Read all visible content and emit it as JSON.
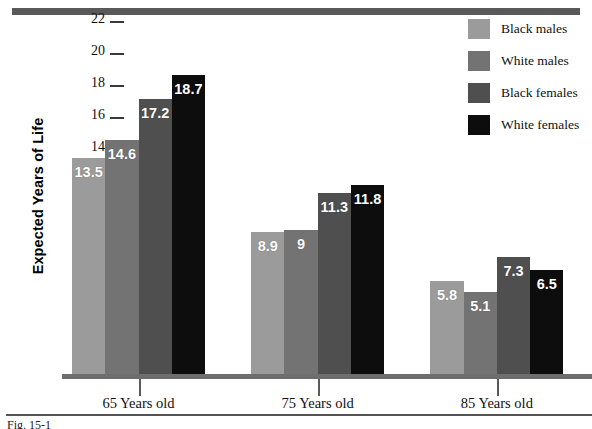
{
  "chart_data": {
    "type": "bar",
    "title": "",
    "xlabel": "",
    "ylabel": "Expected Years of Life",
    "ylim": [
      0,
      22
    ],
    "yticks": [
      0,
      2,
      4,
      6,
      8,
      10,
      12,
      14,
      16,
      18,
      20,
      22
    ],
    "grid": false,
    "legend_position": "top-right",
    "categories": [
      "65 Years old",
      "75 Years old",
      "85 Years old"
    ],
    "series": [
      {
        "name": "Black males",
        "color": "#9b9b9b",
        "values": [
          13.5,
          8.9,
          5.8
        ],
        "labels": [
          "13.5",
          "8.9",
          "5.8"
        ]
      },
      {
        "name": "White males",
        "color": "#737373",
        "values": [
          14.6,
          9.0,
          5.1
        ],
        "labels": [
          "14.6",
          "9",
          "5.1"
        ]
      },
      {
        "name": "Black females",
        "color": "#4f4f4f",
        "values": [
          17.2,
          11.3,
          7.3
        ],
        "labels": [
          "17.2",
          "11.3",
          "7.3"
        ]
      },
      {
        "name": "White females",
        "color": "#0d0d0d",
        "values": [
          18.7,
          11.8,
          6.5
        ],
        "labels": [
          "18.7",
          "11.8",
          "6.5"
        ]
      }
    ]
  },
  "axis": {
    "y_title": "Expected Years of Life"
  },
  "caption": {
    "text": "Fig. 15-1"
  },
  "colors": {
    "top_rule": "#595959",
    "baseline": "#6e6e6e",
    "tick": "#3a3a3a",
    "value_label": "#ffffff"
  }
}
